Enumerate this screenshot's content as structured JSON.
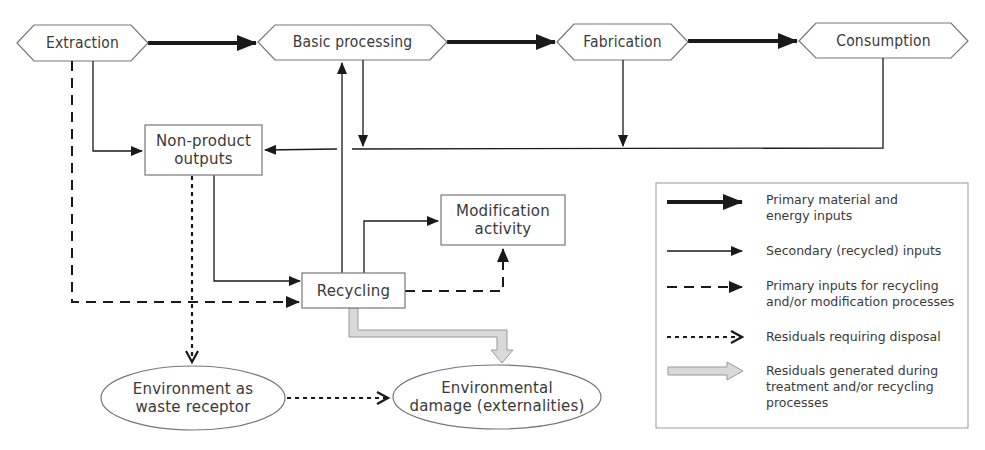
{
  "nodes": {
    "extraction": {
      "label": "Extraction",
      "shape": "hexagon"
    },
    "basic_processing": {
      "label": "Basic processing",
      "shape": "hexagon"
    },
    "fabrication": {
      "label": "Fabrication",
      "shape": "hexagon"
    },
    "consumption": {
      "label": "Consumption",
      "shape": "hexagon"
    },
    "non_product_outputs": {
      "label_line1": "Non-product",
      "label_line2": "outputs",
      "shape": "box"
    },
    "modification_activity": {
      "label_line1": "Modification",
      "label_line2": "activity",
      "shape": "box"
    },
    "recycling": {
      "label": "Recycling",
      "shape": "box"
    },
    "environment_waste_receptor": {
      "label_line1": "Environment as",
      "label_line2": "waste receptor",
      "shape": "ellipse"
    },
    "environmental_damage": {
      "label_line1": "Environmental",
      "label_line2": "damage (externalities)",
      "shape": "ellipse"
    }
  },
  "edges": [
    {
      "from": "Extraction",
      "to": "Basic processing",
      "type": "primary"
    },
    {
      "from": "Basic processing",
      "to": "Fabrication",
      "type": "primary"
    },
    {
      "from": "Fabrication",
      "to": "Consumption",
      "type": "primary"
    },
    {
      "from": "Extraction",
      "to": "Non-product outputs",
      "type": "secondary"
    },
    {
      "from": "Basic processing",
      "to": "Non-product outputs",
      "type": "secondary"
    },
    {
      "from": "Fabrication",
      "to": "Non-product outputs",
      "type": "secondary"
    },
    {
      "from": "Consumption",
      "to": "Non-product outputs",
      "type": "secondary"
    },
    {
      "from": "Non-product outputs",
      "to": "Recycling",
      "type": "secondary"
    },
    {
      "from": "Recycling",
      "to": "Basic processing",
      "type": "secondary"
    },
    {
      "from": "Recycling",
      "to": "Modification activity",
      "type": "secondary"
    },
    {
      "from": "Extraction",
      "to": "Recycling",
      "type": "primary-for-recycling"
    },
    {
      "from": "Recycling",
      "to": "Modification activity",
      "type": "primary-for-recycling"
    },
    {
      "from": "Non-product outputs",
      "to": "Environment as waste receptor",
      "type": "residual-disposal"
    },
    {
      "from": "Environment as waste receptor",
      "to": "Environmental damage (externalities)",
      "type": "residual-disposal"
    },
    {
      "from": "Recycling",
      "to": "Environmental damage (externalities)",
      "type": "residual-treatment"
    }
  ],
  "legend": {
    "items": [
      {
        "style": "thick-solid",
        "line1": "Primary material and",
        "line2": "energy inputs"
      },
      {
        "style": "thin-solid",
        "line1": "Secondary (recycled) inputs"
      },
      {
        "style": "dashed",
        "line1": "Primary inputs for recycling",
        "line2": "and/or modification processes"
      },
      {
        "style": "dotted",
        "line1": "Residuals requiring disposal"
      },
      {
        "style": "gray-hollow",
        "line1": "Residuals generated during",
        "line2": "treatment and/or recycling",
        "line3": "processes"
      }
    ]
  },
  "colors": {
    "line": "#1a1a1a",
    "shape_border": "#777777",
    "gray_arrow_fill": "#d9d9d9",
    "gray_arrow_border": "#999999",
    "text": "#3a3a3a"
  }
}
